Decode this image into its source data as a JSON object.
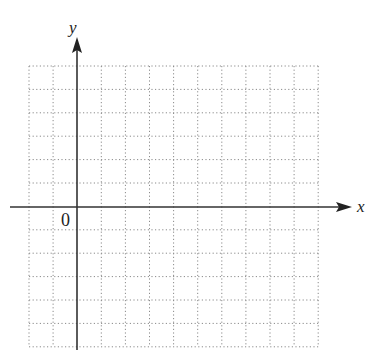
{
  "diagram": {
    "type": "coordinate-grid",
    "axes": {
      "x_label": "x",
      "y_label": "y",
      "origin_label": "0"
    },
    "grid": {
      "columns": 12,
      "rows": 12,
      "columns_left_of_y_axis": 2,
      "rows_above_x_axis": 6,
      "line_style": "dotted",
      "line_color": "#8a8a8a"
    },
    "axis_color": "#333333"
  }
}
